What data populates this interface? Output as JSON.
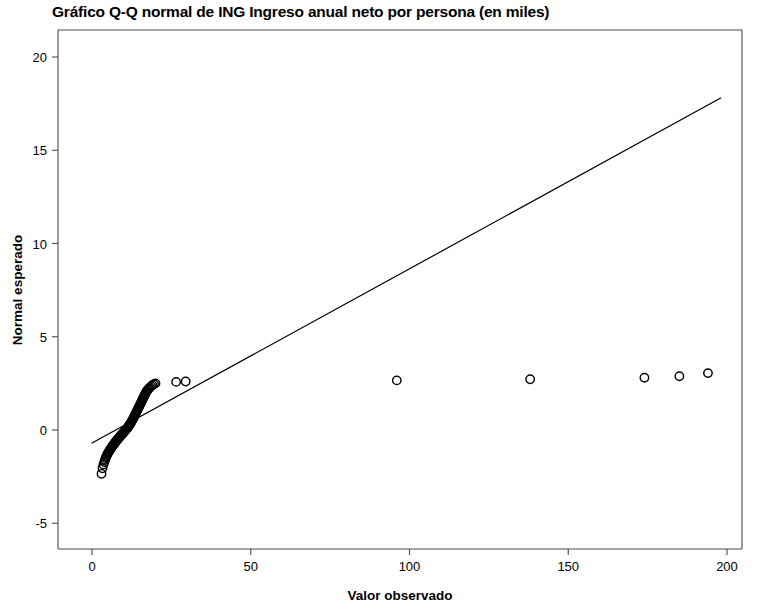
{
  "chart_data": {
    "type": "scatter",
    "title": "Gráfico Q-Q normal de ING Ingreso anual neto por persona (en miles)",
    "xlabel": "Valor observado",
    "ylabel": "Normal esperado",
    "xlim": [
      -6,
      208
    ],
    "ylim": [
      -7.0,
      21.8
    ],
    "xticks": [
      0,
      50,
      100,
      150,
      200
    ],
    "xtick_labels": [
      "0",
      "50",
      "100",
      "150",
      "200"
    ],
    "yticks": [
      -5,
      0,
      5,
      10,
      15,
      20
    ],
    "ytick_labels": [
      "-5",
      "0",
      "5",
      "10",
      "15",
      "20"
    ],
    "grid": false,
    "legend": null,
    "marker": "open-circle",
    "marker_color": "#000000",
    "reference_line": {
      "label": "línea de referencia normal",
      "x_start": 0.0,
      "y_start": -0.7,
      "x_end": 198.0,
      "y_end": 17.8,
      "color": "#000000",
      "width": 1.2
    },
    "points": [
      {
        "x": 3.0,
        "y": -2.35
      },
      {
        "x": 3.3,
        "y": -2.05
      },
      {
        "x": 3.6,
        "y": -1.85
      },
      {
        "x": 3.9,
        "y": -1.72
      },
      {
        "x": 4.1,
        "y": -1.6
      },
      {
        "x": 4.3,
        "y": -1.5
      },
      {
        "x": 4.5,
        "y": -1.42
      },
      {
        "x": 4.7,
        "y": -1.35
      },
      {
        "x": 4.9,
        "y": -1.28
      },
      {
        "x": 5.1,
        "y": -1.22
      },
      {
        "x": 5.3,
        "y": -1.16
      },
      {
        "x": 5.5,
        "y": -1.1
      },
      {
        "x": 5.7,
        "y": -1.05
      },
      {
        "x": 5.9,
        "y": -1.0
      },
      {
        "x": 6.1,
        "y": -0.95
      },
      {
        "x": 6.3,
        "y": -0.9
      },
      {
        "x": 6.5,
        "y": -0.85
      },
      {
        "x": 6.7,
        "y": -0.8
      },
      {
        "x": 6.9,
        "y": -0.76
      },
      {
        "x": 7.1,
        "y": -0.71
      },
      {
        "x": 7.3,
        "y": -0.67
      },
      {
        "x": 7.5,
        "y": -0.62
      },
      {
        "x": 7.7,
        "y": -0.58
      },
      {
        "x": 7.9,
        "y": -0.54
      },
      {
        "x": 8.1,
        "y": -0.5
      },
      {
        "x": 8.3,
        "y": -0.46
      },
      {
        "x": 8.5,
        "y": -0.42
      },
      {
        "x": 8.7,
        "y": -0.38
      },
      {
        "x": 8.9,
        "y": -0.34
      },
      {
        "x": 9.1,
        "y": -0.3
      },
      {
        "x": 9.3,
        "y": -0.26
      },
      {
        "x": 9.5,
        "y": -0.22
      },
      {
        "x": 9.7,
        "y": -0.18
      },
      {
        "x": 9.9,
        "y": -0.14
      },
      {
        "x": 10.1,
        "y": -0.1
      },
      {
        "x": 10.3,
        "y": -0.06
      },
      {
        "x": 10.5,
        "y": -0.02
      },
      {
        "x": 10.7,
        "y": 0.02
      },
      {
        "x": 10.9,
        "y": 0.06
      },
      {
        "x": 11.1,
        "y": 0.1
      },
      {
        "x": 11.3,
        "y": 0.15
      },
      {
        "x": 11.5,
        "y": 0.2
      },
      {
        "x": 11.7,
        "y": 0.25
      },
      {
        "x": 11.9,
        "y": 0.3
      },
      {
        "x": 12.1,
        "y": 0.35
      },
      {
        "x": 12.3,
        "y": 0.41
      },
      {
        "x": 12.5,
        "y": 0.47
      },
      {
        "x": 12.7,
        "y": 0.53
      },
      {
        "x": 12.9,
        "y": 0.59
      },
      {
        "x": 13.1,
        "y": 0.65
      },
      {
        "x": 13.3,
        "y": 0.72
      },
      {
        "x": 13.5,
        "y": 0.79
      },
      {
        "x": 13.7,
        "y": 0.86
      },
      {
        "x": 13.9,
        "y": 0.93
      },
      {
        "x": 14.1,
        "y": 1.0
      },
      {
        "x": 14.3,
        "y": 1.07
      },
      {
        "x": 14.5,
        "y": 1.14
      },
      {
        "x": 14.7,
        "y": 1.21
      },
      {
        "x": 14.9,
        "y": 1.28
      },
      {
        "x": 15.1,
        "y": 1.35
      },
      {
        "x": 15.3,
        "y": 1.42
      },
      {
        "x": 15.5,
        "y": 1.49
      },
      {
        "x": 15.7,
        "y": 1.56
      },
      {
        "x": 15.9,
        "y": 1.63
      },
      {
        "x": 16.1,
        "y": 1.7
      },
      {
        "x": 16.3,
        "y": 1.77
      },
      {
        "x": 16.5,
        "y": 1.84
      },
      {
        "x": 16.7,
        "y": 1.91
      },
      {
        "x": 16.9,
        "y": 1.98
      },
      {
        "x": 17.1,
        "y": 2.04
      },
      {
        "x": 17.3,
        "y": 2.1
      },
      {
        "x": 17.6,
        "y": 2.16
      },
      {
        "x": 17.9,
        "y": 2.22
      },
      {
        "x": 18.2,
        "y": 2.28
      },
      {
        "x": 18.6,
        "y": 2.34
      },
      {
        "x": 19.0,
        "y": 2.4
      },
      {
        "x": 19.5,
        "y": 2.46
      },
      {
        "x": 20.0,
        "y": 2.5
      },
      {
        "x": 26.5,
        "y": 2.58
      },
      {
        "x": 29.5,
        "y": 2.6
      },
      {
        "x": 96.0,
        "y": 2.66
      },
      {
        "x": 138.0,
        "y": 2.72
      },
      {
        "x": 174.0,
        "y": 2.8
      },
      {
        "x": 185.0,
        "y": 2.88
      },
      {
        "x": 194.0,
        "y": 3.05
      }
    ]
  },
  "plot_geometry": {
    "frame_left": 58,
    "frame_top": 30,
    "frame_right": 742,
    "frame_bottom": 549,
    "x_zero_px": 92,
    "x_px_per_unit": 3.175,
    "y_zero_px": 430,
    "y_px_per_unit": 18.65,
    "frame_color": "#4a4a4a",
    "frame_width": 1.1,
    "tick_length": 6
  }
}
